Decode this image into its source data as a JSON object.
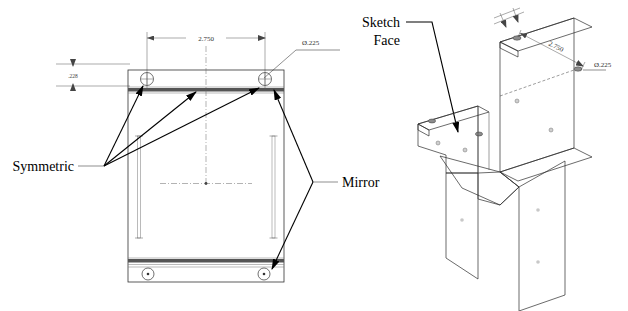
{
  "drawing": {
    "title": "Sheet metal bracket – symmetric / mirror annotation drawing",
    "annotations": {
      "symmetric_label": "Symmetric",
      "mirror_label": "Mirror",
      "sketch_face_line1": "Sketch",
      "sketch_face_line2": "Face"
    },
    "dimensions": {
      "width_front": "2.750",
      "hole_dia_front": "Ø.225",
      "edge_offset_front": ".228",
      "width_iso": "2.750",
      "hole_dia_iso": "Ø.225"
    },
    "colors": {
      "face_light": "#b4b4b4",
      "face_mid": "#9a9a9a",
      "face_dark": "#4f4f4f",
      "face_darker": "#3f3f3f",
      "outline": "#2b2b2b",
      "dim_line": "#555555",
      "text": "#000000",
      "background": "#ffffff"
    },
    "views": {
      "front_view_name": "front-orthographic-view",
      "iso_view_name": "isometric-model-view"
    }
  }
}
